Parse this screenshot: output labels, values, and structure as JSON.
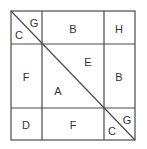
{
  "diagram": {
    "grid": {
      "left": 11,
      "top": 11,
      "right": 135,
      "bottom": 140,
      "col_lines": [
        42,
        104
      ],
      "row_lines": [
        44,
        108
      ],
      "line_color": "#4a4a4a",
      "background": "#ffffff"
    },
    "diagonal": {
      "from": [
        11,
        11
      ],
      "to": [
        135,
        140
      ]
    },
    "cells": [
      {
        "id": "top-left-upper",
        "label": "G",
        "x": 34,
        "y": 27
      },
      {
        "id": "top-left-lower",
        "label": "C",
        "x": 19,
        "y": 39
      },
      {
        "id": "top-middle",
        "label": "B",
        "x": 73,
        "y": 33
      },
      {
        "id": "top-right",
        "label": "H",
        "x": 119,
        "y": 33
      },
      {
        "id": "middle-left",
        "label": "F",
        "x": 26,
        "y": 81
      },
      {
        "id": "middle-center-upper",
        "label": "E",
        "x": 88,
        "y": 66
      },
      {
        "id": "middle-center-lower",
        "label": "A",
        "x": 58,
        "y": 95
      },
      {
        "id": "middle-right",
        "label": "B",
        "x": 119,
        "y": 81
      },
      {
        "id": "bottom-left",
        "label": "D",
        "x": 26,
        "y": 129
      },
      {
        "id": "bottom-middle",
        "label": "F",
        "x": 73,
        "y": 129
      },
      {
        "id": "bottom-right-upper",
        "label": "G",
        "x": 127,
        "y": 124
      },
      {
        "id": "bottom-right-lower",
        "label": "C",
        "x": 112,
        "y": 135
      }
    ]
  }
}
